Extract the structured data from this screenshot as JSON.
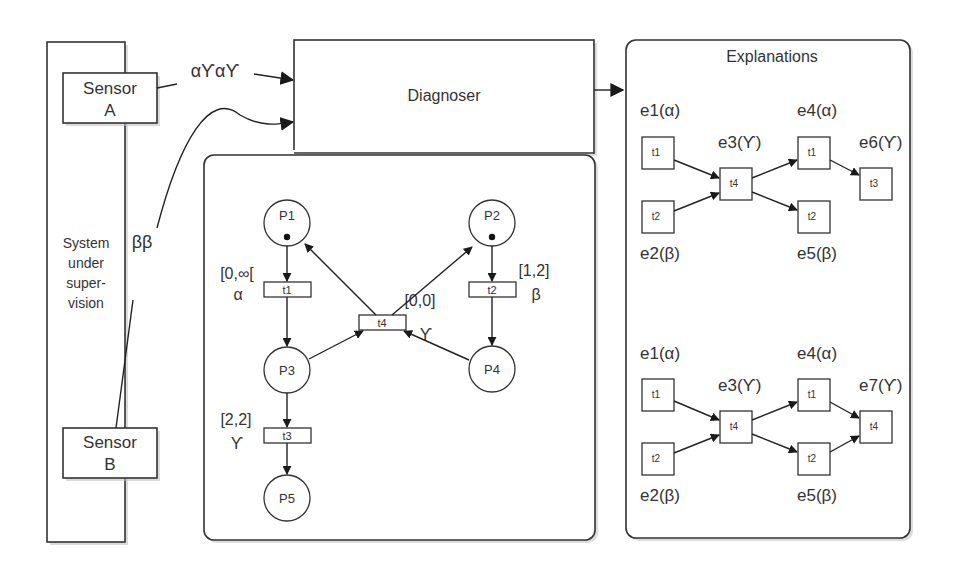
{
  "system": {
    "label_lines": [
      "System",
      "under",
      "super-",
      "vision"
    ],
    "sensor_a": {
      "line1": "Sensor",
      "line2": "A",
      "observation": "αϒαϒ"
    },
    "sensor_b": {
      "line1": "Sensor",
      "line2": "B",
      "observation": "ββ"
    }
  },
  "diagnoser": {
    "title": "Diagnoser"
  },
  "petri_net": {
    "places": [
      {
        "id": "P1",
        "token": true
      },
      {
        "id": "P2",
        "token": true
      },
      {
        "id": "P3",
        "token": false
      },
      {
        "id": "P4",
        "token": false
      },
      {
        "id": "P5",
        "token": false
      }
    ],
    "transitions": [
      {
        "id": "t1",
        "interval": "[0,∞[",
        "label": "α"
      },
      {
        "id": "t2",
        "interval": "[1,2]",
        "label": "β"
      },
      {
        "id": "t3",
        "interval": "[2,2]",
        "label": "ϒ"
      },
      {
        "id": "t4",
        "interval": "[0,0]",
        "label": "ϒ"
      }
    ]
  },
  "explanations": {
    "title": "Explanations",
    "graphs": [
      {
        "events": [
          {
            "name": "e1(α)",
            "transition": "t1"
          },
          {
            "name": "e2(β)",
            "transition": "t2"
          },
          {
            "name": "e3(ϒ)",
            "transition": "t4"
          },
          {
            "name": "e4(α)",
            "transition": "t1"
          },
          {
            "name": "e5(β)",
            "transition": "t2"
          },
          {
            "name": "e6(ϒ)",
            "transition": "t3"
          }
        ]
      },
      {
        "events": [
          {
            "name": "e1(α)",
            "transition": "t1"
          },
          {
            "name": "e2(β)",
            "transition": "t2"
          },
          {
            "name": "e3(ϒ)",
            "transition": "t4"
          },
          {
            "name": "e4(α)",
            "transition": "t1"
          },
          {
            "name": "e5(β)",
            "transition": "t2"
          },
          {
            "name": "e7(ϒ)",
            "transition": "t4"
          }
        ]
      }
    ]
  }
}
